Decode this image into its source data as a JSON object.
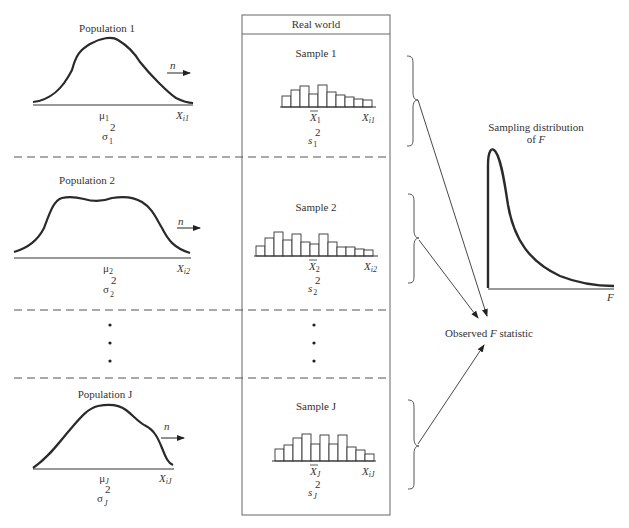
{
  "header": {
    "title": "Real world"
  },
  "populations": [
    {
      "label": "Population 1",
      "mean": "μ",
      "mean_sub": "1",
      "variance": "σ",
      "variance_sub": "1",
      "variance_sup": "2",
      "x_label": "X",
      "x_sub": "i1",
      "arrow_label": "n"
    },
    {
      "label": "Population 2",
      "mean": "μ",
      "mean_sub": "2",
      "variance": "σ",
      "variance_sub": "2",
      "variance_sup": "2",
      "x_label": "X",
      "x_sub": "i2",
      "arrow_label": "n"
    },
    {
      "label": "Population J",
      "mean": "μ",
      "mean_sub": "J",
      "variance": "σ",
      "variance_sub": "J",
      "variance_sup": "2",
      "x_label": "X",
      "x_sub": "iJ",
      "arrow_label": "n"
    }
  ],
  "samples": [
    {
      "label": "Sample 1",
      "mean": "X",
      "mean_sub": "1",
      "variance": "s",
      "variance_sub": "1",
      "variance_sup": "2",
      "x_label": "X",
      "x_sub": "i1",
      "bars": [
        11,
        17,
        21,
        13,
        22,
        15,
        12,
        10,
        8,
        7
      ]
    },
    {
      "label": "Sample 2",
      "mean": "X",
      "mean_sub": "2",
      "variance": "s",
      "variance_sub": "2",
      "variance_sup": "2",
      "x_label": "X",
      "x_sub": "i2",
      "bars": [
        10,
        18,
        24,
        16,
        22,
        14,
        12,
        22,
        14,
        9,
        9,
        7,
        6
      ]
    },
    {
      "label": "Sample J",
      "mean": "X",
      "mean_sub": "J",
      "variance": "s",
      "variance_sub": "J",
      "variance_sup": "2",
      "x_label": "X",
      "x_sub": "iJ",
      "bars": [
        12,
        16,
        23,
        27,
        17,
        26,
        17,
        26,
        14,
        11,
        7
      ]
    }
  ],
  "ellipsis": "•",
  "sampling_distribution": {
    "title_line1": "Sampling distribution",
    "title_line2_prefix": "of ",
    "title_line2_var": "F",
    "axis_label": "F"
  },
  "observed": {
    "prefix": "Observed ",
    "var": "F",
    "suffix": " statistic"
  },
  "colors": {
    "line": "#2a2a2a",
    "dashed": "#555555",
    "box": "#666666"
  }
}
